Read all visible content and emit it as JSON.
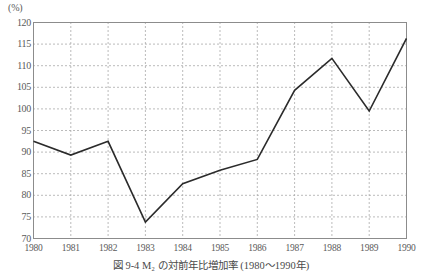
{
  "figure": {
    "unit_label": "(%)",
    "caption": "図 9-4  M₂ の対前年比増加率 (1980～1990年)"
  },
  "chart_data": {
    "type": "line",
    "title": "図 9-4  M₂ の対前年比増加率 (1980～1990年)",
    "xlabel": "",
    "ylabel": "(%)",
    "categories": [
      "1980",
      "1981",
      "1982",
      "1983",
      "1984",
      "1985",
      "1986",
      "1987",
      "1988",
      "1989",
      "1990"
    ],
    "values": [
      92.5,
      89.3,
      92.5,
      73.8,
      82.7,
      85.8,
      88.3,
      104.3,
      111.7,
      99.5,
      116.3
    ],
    "ylim": [
      70,
      120
    ],
    "yticks": [
      70,
      75,
      80,
      85,
      90,
      95,
      100,
      105,
      110,
      115,
      120
    ],
    "ytick_labels": [
      "70",
      "75",
      "80",
      "85",
      "90",
      "95",
      "100",
      "105",
      "110",
      "115",
      "120"
    ],
    "grid": "both-dotted",
    "legend": "none",
    "line_color": "#2b2b2b",
    "grid_color": "#aaaaaa",
    "frame_color": "#8c8c8c",
    "background": "#ffffff"
  }
}
